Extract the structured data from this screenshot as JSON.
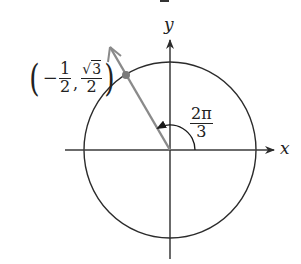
{
  "figure": {
    "type": "unit-circle-angle",
    "axes": {
      "x_label": "x",
      "y_label": "y"
    },
    "angle": {
      "label_numerator": "2π",
      "label_denominator": "3",
      "radians": "2π/3",
      "degrees": 120
    },
    "point": {
      "x_sign": "−",
      "x_numerator": "1",
      "x_denominator": "2",
      "y_sqrt_symbol": "√",
      "y_numerator_radicand": "3",
      "y_denominator": "2",
      "open_paren": "(",
      "close_paren": ")",
      "comma": ","
    },
    "colors": {
      "axes": "#2b2b2b",
      "circle": "#2b2b2b",
      "terminal_ray": "#8a8a8a",
      "point": "#7a7a7a",
      "background": "#ffffff"
    }
  }
}
